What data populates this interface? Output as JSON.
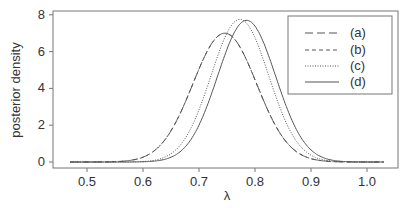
{
  "chart_data": {
    "type": "line",
    "title": "",
    "xlabel": "λ",
    "ylabel": "posterior density",
    "xlim": [
      0.45,
      1.05
    ],
    "ylim": [
      0,
      8
    ],
    "xticks": [
      "0.5",
      "0.6",
      "0.7",
      "0.8",
      "0.9",
      "1.0"
    ],
    "yticks": [
      "0",
      "2",
      "4",
      "6",
      "8"
    ],
    "grid": false,
    "legend_position": "top-right",
    "series": [
      {
        "name": "(a)",
        "style": "longdash",
        "mean": 0.746,
        "peak": 7.0
      },
      {
        "name": "(b)",
        "style": "dashed",
        "mean": 0.746,
        "peak": 7.0
      },
      {
        "name": "(c)",
        "style": "dotted",
        "mean": 0.773,
        "peak": 7.75
      },
      {
        "name": "(d)",
        "style": "solid",
        "mean": 0.785,
        "peak": 7.7
      }
    ],
    "x_range_drawn": [
      0.47,
      1.03
    ]
  },
  "legend": {
    "a": "(a)",
    "b": "(b)",
    "c": "(c)",
    "d": "(d)"
  },
  "axes": {
    "xlabel": "λ",
    "ylabel": "posterior density"
  }
}
